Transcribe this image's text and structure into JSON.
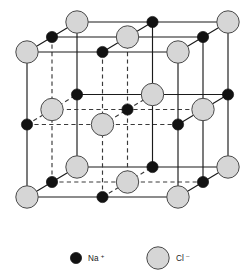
{
  "figure": {
    "type": "crystal-structure-diagram"
  },
  "legend": {
    "items": [
      {
        "id": "na-plus",
        "label": "Na",
        "charge": "+",
        "marker": "small-black-circle",
        "color": "#121212",
        "radius_px": 5.6
      },
      {
        "id": "cl-minus",
        "label": "Cl",
        "charge": "–",
        "marker": "large-gray-circle",
        "color": "#d6d6d6",
        "outline": "#4a4a4a",
        "radius_px": 11.2
      }
    ]
  },
  "lattice": {
    "description": "3 x 3 x 3 alternating ion lattice drawn in isometric projection",
    "grid_divisions": 2,
    "front_face": {
      "left": 27,
      "right": 178,
      "top": 52,
      "bottom": 197
    },
    "depth_offset": {
      "dx": 50,
      "dy": -30
    },
    "edge_styles": {
      "visible": "solid",
      "hidden": "dashed"
    },
    "ion_order": [
      "Cl",
      "Na"
    ],
    "cl_count": 14,
    "na_count": 13
  },
  "chart_data": {
    "type": "scatter",
    "xlabel": "",
    "ylabel": "",
    "series": [
      {
        "name": "Na +",
        "marker": "small-black-circle",
        "color": "#121212",
        "lattice_indices": [
          [
            1,
            0,
            0
          ],
          [
            0,
            1,
            0
          ],
          [
            0,
            0,
            1
          ],
          [
            2,
            1,
            0
          ],
          [
            1,
            2,
            0
          ],
          [
            2,
            0,
            1
          ],
          [
            0,
            2,
            1
          ],
          [
            1,
            0,
            2
          ],
          [
            0,
            1,
            2
          ],
          [
            2,
            2,
            1
          ],
          [
            2,
            1,
            2
          ],
          [
            1,
            2,
            2
          ],
          [
            1,
            1,
            1
          ]
        ]
      },
      {
        "name": "Cl –",
        "marker": "large-gray-circle",
        "color": "#d6d6d6",
        "lattice_indices": [
          [
            0,
            0,
            0
          ],
          [
            2,
            0,
            0
          ],
          [
            0,
            2,
            0
          ],
          [
            2,
            2,
            0
          ],
          [
            0,
            0,
            2
          ],
          [
            2,
            0,
            2
          ],
          [
            0,
            2,
            2
          ],
          [
            2,
            2,
            2
          ],
          [
            1,
            1,
            0
          ],
          [
            1,
            0,
            1
          ],
          [
            0,
            1,
            1
          ],
          [
            2,
            1,
            1
          ],
          [
            1,
            2,
            1
          ],
          [
            1,
            1,
            2
          ]
        ]
      }
    ]
  }
}
